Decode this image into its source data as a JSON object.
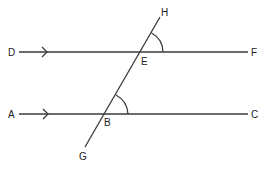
{
  "diagram": {
    "title": "",
    "lines": [
      {
        "id": "DF",
        "from": "D",
        "to": "F",
        "parallel_marker": true
      },
      {
        "id": "AC",
        "from": "A",
        "to": "C",
        "parallel_marker": true
      },
      {
        "id": "GH",
        "from": "G",
        "to": "H",
        "role": "transversal"
      }
    ],
    "points": {
      "D": "D",
      "F": "F",
      "E": "E",
      "H": "H",
      "A": "A",
      "C": "C",
      "B": "B",
      "G": "G"
    },
    "angles": [
      {
        "vertex": "E",
        "between": [
          "H",
          "F"
        ],
        "marked": true
      },
      {
        "vertex": "B",
        "between": [
          "E",
          "C"
        ],
        "marked": true
      }
    ],
    "colors": {
      "line": "#3a3a3a",
      "label": "#222222",
      "background": "#ffffff"
    }
  }
}
